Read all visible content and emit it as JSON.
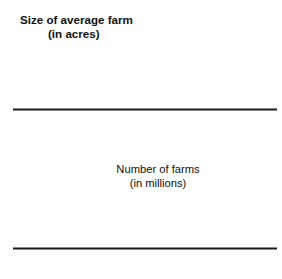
{
  "figure": {
    "name": "us-farms-double-chart",
    "background": "#ffffff"
  },
  "colors": {
    "bar_fill": "#c9c9c9",
    "bar_stroke": "#2b2b2b",
    "axis": "#1a1a1a",
    "line": "#111111",
    "marker": "#111111",
    "text": "#111111"
  },
  "bar_panel": {
    "title_line1": "Size of average farm",
    "title_line2": "(in acres)"
  },
  "line_panel": {
    "title_line1": "Number of farms",
    "title_line2": "(in millions)"
  },
  "chart_data": [
    {
      "type": "bar",
      "title": "Size of average farm (in acres)",
      "xlabel": "",
      "ylabel": "Size of average farm (in acres)",
      "categories": [
        "1940",
        "1950",
        "1960",
        "1970",
        "1980",
        "1990",
        "2000",
        "2010"
      ],
      "values": [
        174,
        213,
        297,
        374,
        426,
        460,
        436,
        418
      ],
      "value_labels": [
        "174",
        "213",
        "297",
        "374",
        "426",
        "460",
        "436",
        "418"
      ],
      "ylim": [
        0,
        460
      ],
      "grid": false,
      "legend": false,
      "bar_fill": "#c9c9c9",
      "bar_edge": "#2b2b2b"
    },
    {
      "type": "line",
      "title": "Number of farms (in millions)",
      "xlabel": "",
      "ylabel": "Number of farms (in millions)",
      "categories": [
        "1940",
        "1950",
        "1960",
        "1970",
        "1980",
        "1990",
        "2000",
        "2010"
      ],
      "values": [
        6.3,
        5.6,
        4.0,
        2.9,
        2.9,
        2.4,
        2.2,
        2.2
      ],
      "value_labels": [
        "6.3",
        "5.6",
        "4.0",
        "2.9",
        "2.9",
        "2.4",
        "2.2",
        "2.2"
      ],
      "ylim": [
        0,
        6.3
      ],
      "grid": false,
      "legend": false,
      "marker": "square",
      "marker_color": "#111111",
      "line_color": "#111111"
    }
  ]
}
